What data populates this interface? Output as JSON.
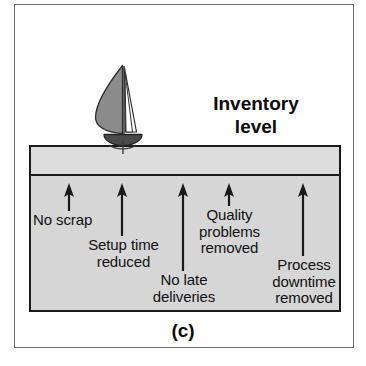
{
  "figure": {
    "caption": "(c)",
    "inventory_title": "Inventory\nlevel",
    "colors": {
      "water_fill": "#d6d6d6",
      "surface_fill": "#dcdcdc",
      "outline": "#1a1a1a",
      "frame": "#6d6d6d",
      "sail_fill": "#8c8c8c",
      "jib_fill": "#ffffff",
      "hull_fill": "#4a4a4a",
      "text": "#111111",
      "page_background": "#ffffff"
    }
  },
  "boat": {
    "name": "sailboat",
    "mainsail_label": "mainsail",
    "jib_label": "jib",
    "hull_label": "hull",
    "keel_label": "keel"
  },
  "arrows": [
    {
      "id": "no-scrap",
      "label": "No scrap",
      "x": 69,
      "tip_y": 183,
      "tail_y": 211,
      "label_x": 33,
      "label_y": 212,
      "label_align": "left",
      "label_width": 95
    },
    {
      "id": "setup-time-reduced",
      "label": "Setup time\nreduced",
      "x": 122,
      "tip_y": 183,
      "tail_y": 236,
      "label_x": 72,
      "label_y": 237,
      "label_align": "center",
      "label_width": 103
    },
    {
      "id": "no-late-deliveries",
      "label": "No late\ndeliveries",
      "x": 183,
      "tip_y": 183,
      "tail_y": 271,
      "label_x": 143,
      "label_y": 272,
      "label_align": "center",
      "label_width": 82
    },
    {
      "id": "quality-problems-removed",
      "label": "Quality\nproblems\nremoved",
      "x": 229,
      "tip_y": 183,
      "tail_y": 206,
      "label_x": 188,
      "label_y": 207,
      "label_align": "center",
      "label_width": 83
    },
    {
      "id": "process-downtime-removed",
      "label": "Process\ndowntime\nremoved",
      "x": 303,
      "tip_y": 183,
      "tail_y": 256,
      "label_x": 262,
      "label_y": 257,
      "label_align": "center",
      "label_width": 84
    }
  ]
}
